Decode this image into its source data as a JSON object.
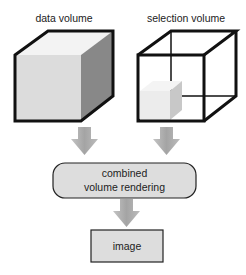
{
  "diagram": {
    "nodes": [
      {
        "id": "data_volume",
        "label": "data volume",
        "shape": "solid-cube"
      },
      {
        "id": "selection_volume",
        "label": "selection volume",
        "shape": "wireframe-cube-with-small-solid-cube"
      },
      {
        "id": "combined",
        "label_lines": [
          "combined",
          "volume rendering"
        ],
        "shape": "rounded-rectangle"
      },
      {
        "id": "image",
        "label": "image",
        "shape": "rectangle"
      }
    ],
    "edges": [
      {
        "from": "data_volume",
        "to": "combined"
      },
      {
        "from": "selection_volume",
        "to": "combined"
      },
      {
        "from": "combined",
        "to": "image"
      }
    ],
    "colors": {
      "outline": "#111111",
      "cube_front": "#dcdcdc",
      "cube_top": "#f2f2f2",
      "cube_side": "#8a8a8a",
      "box_fill": "#dddddd",
      "arrow_fill": "#aaaaaa"
    }
  }
}
